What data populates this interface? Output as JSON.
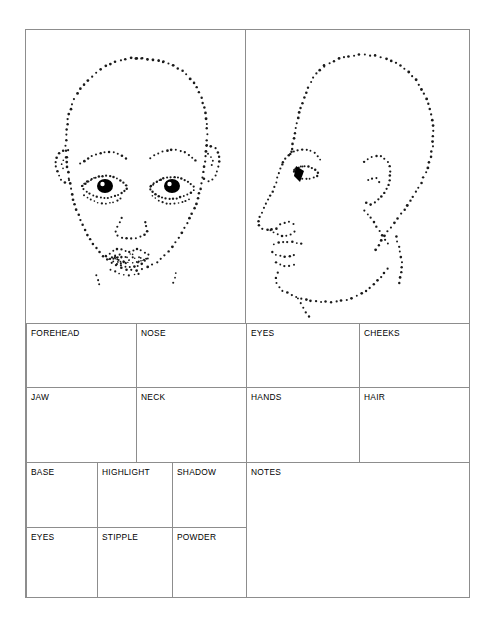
{
  "document": {
    "type": "makeup-face-chart-worksheet",
    "paper_color": "#ffffff",
    "ink_color": "#000000",
    "rule_color": "#8d8d8d"
  },
  "illustrations": {
    "front_view": {
      "name": "stippled-frontal-face",
      "description": "Dotted stipple outline of a frontal human face with eyebrows, eyes with dark irises, nose and lips"
    },
    "profile_view": {
      "name": "stippled-profile-face",
      "description": "Dotted stipple outline of a human head in left-facing profile with eye, nose, lips, chin, ear and neck"
    }
  },
  "grid": {
    "row1": [
      {
        "label": "FOREHEAD",
        "value": ""
      },
      {
        "label": "NOSE",
        "value": ""
      },
      {
        "label": "EYES",
        "value": ""
      },
      {
        "label": "CHEEKS",
        "value": ""
      }
    ],
    "row2": [
      {
        "label": "JAW",
        "value": ""
      },
      {
        "label": "NECK",
        "value": ""
      },
      {
        "label": "HANDS",
        "value": ""
      },
      {
        "label": "HAIR",
        "value": ""
      }
    ],
    "row3": [
      {
        "label": "BASE",
        "value": ""
      },
      {
        "label": "HIGHLIGHT",
        "value": ""
      },
      {
        "label": "SHADOW",
        "value": ""
      }
    ],
    "row4": [
      {
        "label": "EYES",
        "value": ""
      },
      {
        "label": "STIPPLE",
        "value": ""
      },
      {
        "label": "POWDER",
        "value": ""
      }
    ],
    "notes": {
      "label": "NOTES",
      "value": ""
    }
  }
}
